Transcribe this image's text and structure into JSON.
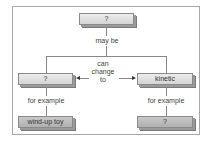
{
  "diagram": {
    "top_node": {
      "label": "?"
    },
    "top_edge_label": "may be",
    "left_node": {
      "label": "?"
    },
    "right_node": {
      "label": "kinetic"
    },
    "middle_edge_label": "can\nchange\nto",
    "middle_edge_lines": [
      "can",
      "change",
      "to"
    ],
    "left_edge_label": "for example",
    "right_edge_label": "for example",
    "left_leaf": {
      "label": "wind-up toy"
    },
    "right_leaf": {
      "label": "?"
    }
  }
}
